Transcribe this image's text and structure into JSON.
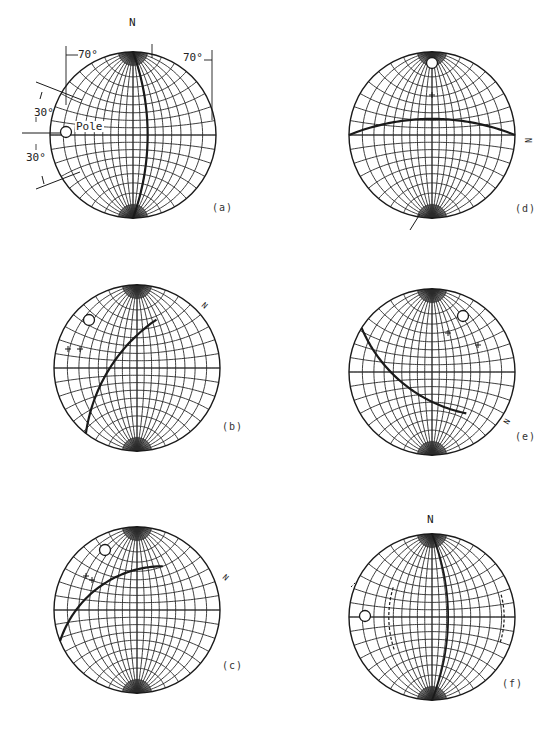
{
  "figure": {
    "panels": [
      {
        "id": "a",
        "label": "(a)",
        "center": [
          133,
          135
        ],
        "radius": 83,
        "north_label": "N",
        "annotations": {
          "angle_left_top": "70°",
          "angle_right_top": "70°",
          "angle_upper": "30°",
          "angle_lower": "30°",
          "pole_label": "Pole"
        },
        "great_circle": "meridian",
        "pole_marker": [
          66,
          132
        ]
      },
      {
        "id": "b",
        "label": "(b)",
        "center": [
          137,
          368
        ],
        "radius": 83,
        "great_circle_end_label": "N",
        "pole_marker": [
          89,
          320
        ]
      },
      {
        "id": "c",
        "label": "(c)",
        "center": [
          137,
          610
        ],
        "radius": 83,
        "great_circle_end_label": "N",
        "pole_marker": [
          105,
          550
        ]
      },
      {
        "id": "d",
        "label": "(d)",
        "center": [
          432,
          135
        ],
        "radius": 83,
        "great_circle_end_label": "N",
        "pole_marker": [
          432,
          63
        ]
      },
      {
        "id": "e",
        "label": "(e)",
        "center": [
          432,
          372
        ],
        "radius": 83,
        "great_circle_end_label": "N",
        "pole_marker": [
          463,
          316
        ]
      },
      {
        "id": "f",
        "label": "(f)",
        "center": [
          432,
          617
        ],
        "radius": 83,
        "north_label": "N",
        "pole_marker": [
          365,
          616
        ]
      }
    ]
  },
  "colors": {
    "ink": "#1a1a1a",
    "grid": "#2a2a2a",
    "background": "#ffffff"
  }
}
